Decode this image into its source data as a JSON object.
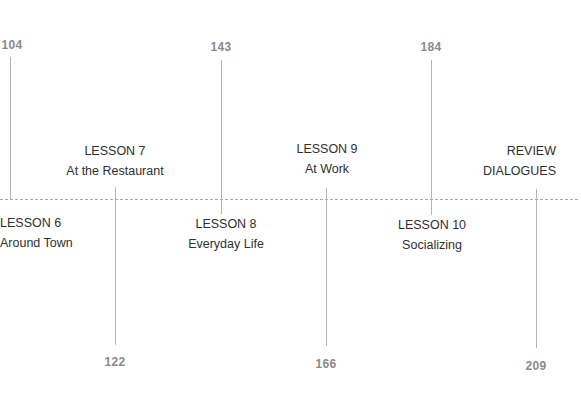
{
  "timeline": {
    "axis": {
      "style": "dashed",
      "color": "#a9a9a9"
    },
    "colors": {
      "tick": "#b4b4b4",
      "page_number": "#8a8a8a",
      "label": "#2f2f2f"
    },
    "lessons": [
      {
        "id": "lesson-6",
        "title": "LESSON 6",
        "subtitle": "Around Town",
        "page": "104",
        "page_position": "top"
      },
      {
        "id": "lesson-7",
        "title": "LESSON 7",
        "subtitle": "At the Restaurant",
        "page": "122",
        "page_position": "bottom"
      },
      {
        "id": "lesson-8",
        "title": "LESSON 8",
        "subtitle": "Everyday Life",
        "page": "143",
        "page_position": "top"
      },
      {
        "id": "lesson-9",
        "title": "LESSON 9",
        "subtitle": "At Work",
        "page": "166",
        "page_position": "bottom"
      },
      {
        "id": "lesson-10",
        "title": "LESSON 10",
        "subtitle": "Socializing",
        "page": "184",
        "page_position": "top"
      },
      {
        "id": "review",
        "title": "REVIEW",
        "subtitle": "DIALOGUES",
        "page": "209",
        "page_position": "bottom"
      }
    ]
  }
}
